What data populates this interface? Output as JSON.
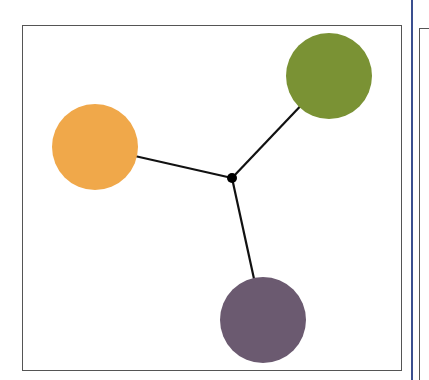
{
  "diagram": {
    "type": "hub-and-spoke",
    "hub": {
      "x": 232,
      "y": 178,
      "r": 5,
      "color": "#000000"
    },
    "nodes": [
      {
        "name": "orange-node",
        "x": 95,
        "y": 147,
        "r": 43,
        "color": "#f0a84a"
      },
      {
        "name": "green-node",
        "x": 329,
        "y": 76,
        "r": 43,
        "color": "#7a9234"
      },
      {
        "name": "purple-node",
        "x": 263,
        "y": 320,
        "r": 43,
        "color": "#6b5a70"
      }
    ],
    "edges": [
      {
        "from": "hub",
        "to": "orange-node"
      },
      {
        "from": "hub",
        "to": "green-node"
      },
      {
        "from": "hub",
        "to": "purple-node"
      }
    ],
    "frame_color": "#555555",
    "separator_color": "#3a4f8f"
  }
}
